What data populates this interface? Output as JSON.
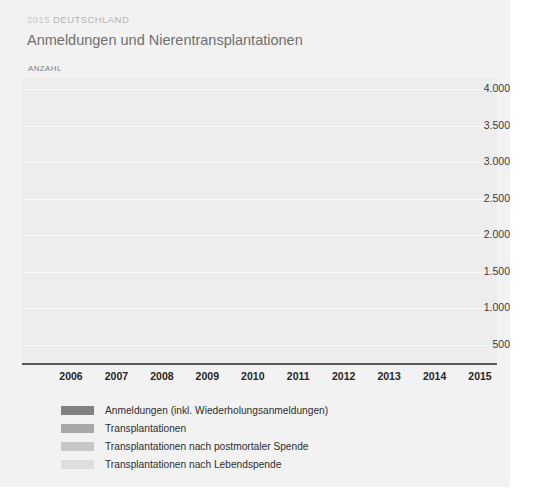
{
  "header": {
    "kicker_year": "2015",
    "kicker_country": "DEUTSCHLAND",
    "title": "Anmeldungen und Nierentransplantationen",
    "axis_unit_label": "ANZAHL"
  },
  "legend": [
    {
      "label": "Anmeldungen (inkl. Wiederholungsanmeldungen)",
      "color": "#808080"
    },
    {
      "label": "Transplantationen",
      "color": "#a8a8a8"
    },
    {
      "label": "Transplantationen nach postmortaler Spende",
      "color": "#c8c8c8"
    },
    {
      "label": "Transplantationen nach Lebendspende",
      "color": "#dedede"
    }
  ],
  "chart_data": {
    "type": "line",
    "title": "Anmeldungen und Nierentransplantationen",
    "subtitle": "2015 DEUTSCHLAND",
    "xlabel": "",
    "ylabel": "ANZAHL",
    "ylim": [
      250,
      4150
    ],
    "yticks": [
      500,
      1000,
      1500,
      2000,
      2500,
      3000,
      3500,
      4000
    ],
    "ytick_labels": [
      "500",
      "1.000",
      "1.500",
      "2.000",
      "2.500",
      "3.000",
      "3.500",
      "4.000"
    ],
    "categories": [
      "2006",
      "2007",
      "2008",
      "2009",
      "2010",
      "2011",
      "2012",
      "2013",
      "2014",
      "2015"
    ],
    "grid": true,
    "legend_position": "bottom-left",
    "series": [
      {
        "name": "Anmeldungen (inkl. Wiederholungsanmeldungen)",
        "color": "#808080",
        "values": [
          3440,
          3610,
          3720,
          3530,
          3810,
          3970,
          3650,
          3230,
          3230,
          3230
        ]
      },
      {
        "name": "Transplantationen",
        "color": "#a8a8a8",
        "values": [
          2960,
          3070,
          2920,
          2960,
          3030,
          3070,
          2870,
          2440,
          2310,
          2360
        ]
      },
      {
        "name": "Transplantationen nach postmortaler Spende",
        "color": "#c8c8c8",
        "values": [
          2380,
          2480,
          2330,
          2330,
          2440,
          2300,
          2180,
          1720,
          1690,
          1750
        ]
      },
      {
        "name": "Transplantationen nach Lebendspende",
        "color": "#dedede",
        "values": [
          650,
          690,
          720,
          740,
          810,
          950,
          930,
          830,
          780,
          820
        ]
      }
    ]
  }
}
